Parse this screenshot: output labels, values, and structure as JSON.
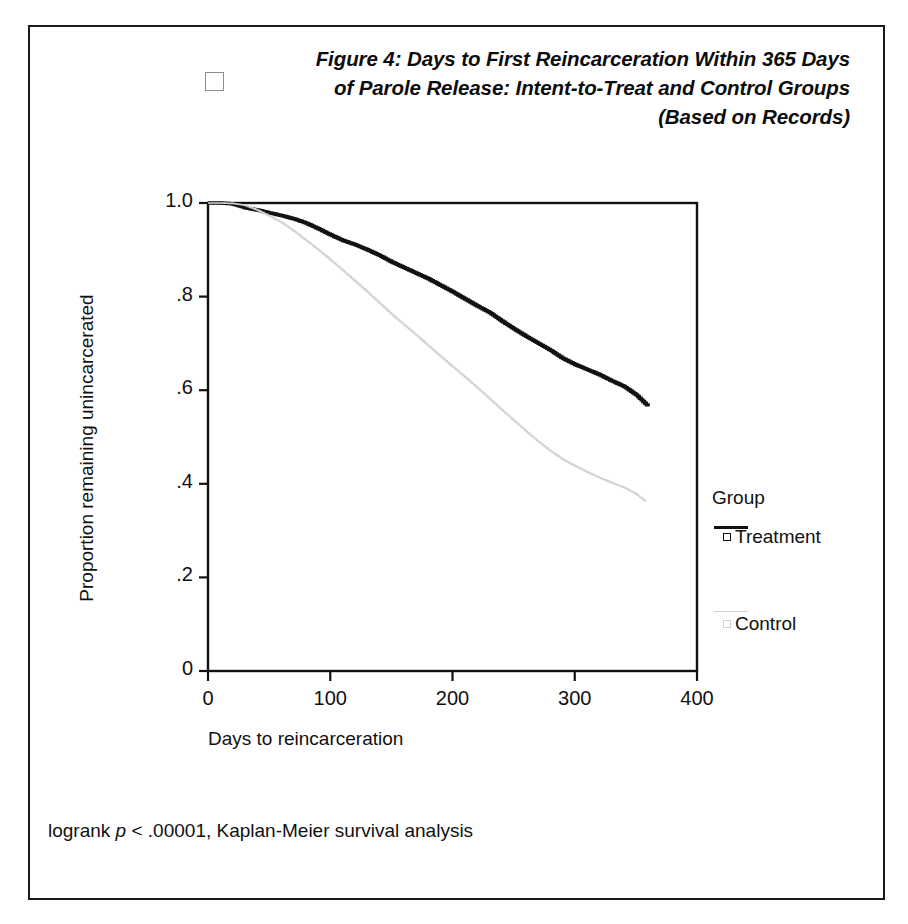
{
  "figure": {
    "title_lines": [
      "Figure 4: Days to First Reincarceration Within 365 Days",
      "of Parole Release: Intent-to-Treat and Control Groups",
      "(Based on Records)"
    ],
    "checkbox_icon": "empty-checkbox-icon",
    "footnote_prefix": "logrank ",
    "footnote_italic": "p",
    "footnote_suffix": " < .00001, Kaplan-Meier survival analysis"
  },
  "legend": {
    "title": "Group",
    "entries": [
      {
        "label": "Treatment",
        "color": "#111111",
        "marker": "open-square-marker"
      },
      {
        "label": "Control",
        "color": "#d2d2d2",
        "marker": "open-square-marker"
      }
    ]
  },
  "chart_data": {
    "type": "line",
    "title": "Figure 4: Days to First Reincarceration Within 365 Days of Parole Release: Intent-to-Treat and Control Groups (Based on Records)",
    "xlabel": "Days to reincarceration",
    "ylabel": "Proportion remaining unincarcerated",
    "xlim": [
      0,
      400
    ],
    "ylim": [
      0,
      1.0
    ],
    "xticks": [
      0,
      100,
      200,
      300,
      400
    ],
    "xtick_labels": [
      "0",
      "100",
      "200",
      "300",
      "400"
    ],
    "yticks": [
      0,
      0.2,
      0.4,
      0.6,
      0.8,
      1.0
    ],
    "ytick_labels": [
      "0",
      ".2",
      ".4",
      ".6",
      ".8",
      "1.0"
    ],
    "grid": false,
    "legend_position": "right",
    "annotation": "logrank p < .00001, Kaplan-Meier survival analysis",
    "series": [
      {
        "name": "Treatment",
        "color": "#111111",
        "x": [
          0,
          10,
          20,
          30,
          40,
          50,
          60,
          70,
          80,
          90,
          100,
          110,
          120,
          130,
          140,
          150,
          160,
          170,
          180,
          190,
          200,
          210,
          220,
          230,
          240,
          250,
          260,
          270,
          280,
          290,
          300,
          310,
          320,
          330,
          340,
          350,
          360
        ],
        "y": [
          1.0,
          1.0,
          0.998,
          0.99,
          0.985,
          0.979,
          0.973,
          0.966,
          0.957,
          0.945,
          0.932,
          0.92,
          0.911,
          0.9,
          0.888,
          0.874,
          0.862,
          0.85,
          0.838,
          0.824,
          0.81,
          0.795,
          0.78,
          0.766,
          0.748,
          0.731,
          0.715,
          0.7,
          0.685,
          0.668,
          0.655,
          0.644,
          0.633,
          0.62,
          0.608,
          0.59,
          0.565
        ]
      },
      {
        "name": "Control",
        "color": "#d2d2d2",
        "x": [
          0,
          10,
          20,
          30,
          40,
          50,
          60,
          70,
          80,
          90,
          100,
          110,
          120,
          130,
          140,
          150,
          160,
          170,
          180,
          190,
          200,
          210,
          220,
          230,
          240,
          250,
          260,
          270,
          280,
          290,
          300,
          310,
          320,
          330,
          340,
          350,
          358
        ],
        "y": [
          1.0,
          1.0,
          0.999,
          0.995,
          0.985,
          0.972,
          0.958,
          0.94,
          0.92,
          0.9,
          0.878,
          0.856,
          0.833,
          0.81,
          0.786,
          0.762,
          0.74,
          0.718,
          0.695,
          0.672,
          0.65,
          0.628,
          0.605,
          0.582,
          0.558,
          0.535,
          0.512,
          0.49,
          0.47,
          0.452,
          0.438,
          0.425,
          0.413,
          0.402,
          0.392,
          0.378,
          0.362
        ]
      }
    ]
  }
}
